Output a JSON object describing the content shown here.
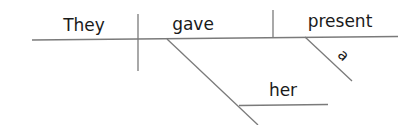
{
  "diagram": {
    "type": "sentence-diagram",
    "sentence": "They gave her a present",
    "words": {
      "subject": "They",
      "verb": "gave",
      "direct_object": "present",
      "indirect_object": "her",
      "modifier": "a"
    },
    "colors": {
      "line": "#7a7a7a",
      "text": "#1a1a1a",
      "background": "#ffffff"
    }
  }
}
